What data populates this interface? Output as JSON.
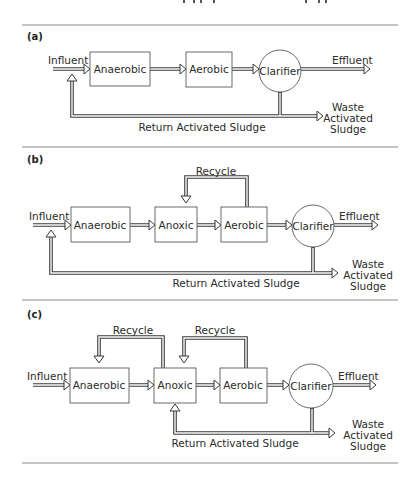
{
  "figure": {
    "panels": [
      {
        "id": "a",
        "label": "(a)",
        "influent": "Influent",
        "units": [
          "Anaerobic",
          "Aerobic"
        ],
        "clarifier": "Clarifier",
        "effluent": "Effluent",
        "return_label": "Return Activated Sludge",
        "waste_label": [
          "Waste",
          "Activated",
          "Sludge"
        ],
        "recycles": []
      },
      {
        "id": "b",
        "label": "(b)",
        "influent": "Influent",
        "units": [
          "Anaerobic",
          "Anoxic",
          "Aerobic"
        ],
        "clarifier": "Clarifier",
        "effluent": "Effluent",
        "return_label": "Return Activated Sludge",
        "waste_label": [
          "Waste",
          "Activated",
          "Sludge"
        ],
        "recycles": [
          {
            "label": "Recycle",
            "from": "Aerobic",
            "to": "Anoxic"
          }
        ]
      },
      {
        "id": "c",
        "label": "(c)",
        "influent": "Influent",
        "units": [
          "Anaerobic",
          "Anoxic",
          "Aerobic"
        ],
        "clarifier": "Clarifier",
        "effluent": "Effluent",
        "return_label": "Return Activated Sludge",
        "waste_label": [
          "Waste",
          "Activated",
          "Sludge"
        ],
        "recycles": [
          {
            "label": "Recycle",
            "from": "Anoxic",
            "to": "Anaerobic"
          },
          {
            "label": "Recycle",
            "from": "Aerobic",
            "to": "Anoxic"
          }
        ]
      }
    ]
  }
}
